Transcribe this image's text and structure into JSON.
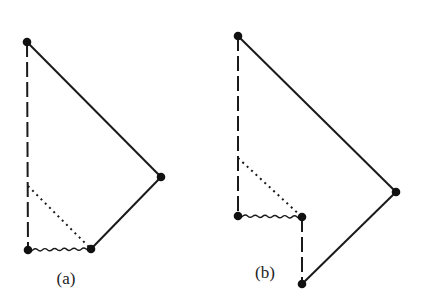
{
  "figure": {
    "panels": [
      {
        "id": "a",
        "label": "(a)",
        "label_pos": [
          66,
          278
        ],
        "nodes": [
          {
            "name": "top",
            "x": 27,
            "y": 42
          },
          {
            "name": "right",
            "x": 161,
            "y": 177
          },
          {
            "name": "bottom-right",
            "x": 91,
            "y": 249
          },
          {
            "name": "bottom-left",
            "x": 28,
            "y": 250
          }
        ],
        "edges": [
          {
            "from": [
              27,
              42
            ],
            "to": [
              161,
              177
            ],
            "style": "solid"
          },
          {
            "from": [
              161,
              177
            ],
            "to": [
              91,
              249
            ],
            "style": "solid"
          },
          {
            "from": [
              27,
              42
            ],
            "to": [
              28,
              250
            ],
            "style": "dashed"
          },
          {
            "from": [
              28,
              250
            ],
            "to": [
              91,
              249
            ],
            "style": "wavy"
          },
          {
            "from": [
              28,
              186
            ],
            "to": [
              91,
              249
            ],
            "style": "dotted"
          }
        ]
      },
      {
        "id": "b",
        "label": "(b)",
        "label_pos": [
          265,
          272
        ],
        "nodes": [
          {
            "name": "top",
            "x": 238,
            "y": 36
          },
          {
            "name": "right",
            "x": 396,
            "y": 192
          },
          {
            "name": "bottom",
            "x": 302,
            "y": 284
          },
          {
            "name": "mid-right",
            "x": 302,
            "y": 217
          },
          {
            "name": "mid-left",
            "x": 238,
            "y": 216
          }
        ],
        "edges": [
          {
            "from": [
              238,
              36
            ],
            "to": [
              396,
              192
            ],
            "style": "solid"
          },
          {
            "from": [
              396,
              192
            ],
            "to": [
              302,
              284
            ],
            "style": "solid"
          },
          {
            "from": [
              238,
              36
            ],
            "to": [
              238,
              216
            ],
            "style": "dashed"
          },
          {
            "from": [
              238,
              216
            ],
            "to": [
              302,
              217
            ],
            "style": "wavy"
          },
          {
            "from": [
              302,
              217
            ],
            "to": [
              302,
              284
            ],
            "style": "dashed"
          },
          {
            "from": [
              238,
              158
            ],
            "to": [
              302,
              217
            ],
            "style": "dotted"
          }
        ]
      }
    ],
    "colors": {
      "stroke": "#1a1a1a",
      "node": "#111111",
      "background": "#ffffff"
    }
  }
}
